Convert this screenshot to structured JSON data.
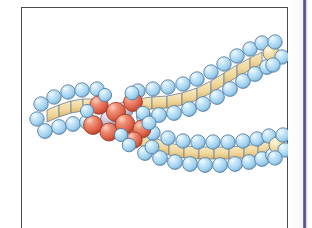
{
  "figure": {
    "caption": "",
    "background_color": "#ffffff",
    "frame_color": "#4a4a52",
    "accent_strip_color": "#5d5184"
  },
  "molecule": {
    "name": "phospholipid",
    "representation": "space-filling",
    "outline_color": "#5b6b86",
    "atoms": {
      "hydrogen": {
        "label": "hydrogen",
        "color": "#a8d4ef",
        "highlight": "#e6f5fd",
        "shadow": "#5f93bb",
        "radius": 7.2
      },
      "carbon": {
        "label": "carbon",
        "color": "#f2d79a",
        "highlight": "#fdf3d8",
        "shadow": "#cfa85c",
        "radius": 8.0
      },
      "oxygen_phosphorus": {
        "label": "oxygen / phosphorus",
        "color": "#e2634a",
        "highlight": "#f6b7a3",
        "shadow": "#b03a26",
        "radius": 9.4
      },
      "nitrogen": {
        "label": "nitrogen",
        "color": "#b9b3c4",
        "highlight": "#e4e0ea",
        "shadow": "#8b849a",
        "radius": 8.2
      }
    },
    "regions": [
      {
        "id": "head-group",
        "label": "polar head group",
        "atom_type": "oxygen_phosphorus"
      },
      {
        "id": "upper-tail",
        "label": "upper hydrocarbon tail",
        "atom_type": "carbon"
      },
      {
        "id": "lower-tail",
        "label": "lower hydrocarbon tail",
        "atom_type": "carbon"
      },
      {
        "id": "left-cap",
        "label": "choline end",
        "atom_type": "carbon"
      }
    ],
    "carbon_chain_upper": [
      [
        118,
        98
      ],
      [
        133,
        96
      ],
      [
        148,
        95
      ],
      [
        163,
        92
      ],
      [
        178,
        87
      ],
      [
        192,
        80
      ],
      [
        205,
        72
      ],
      [
        218,
        64
      ],
      [
        231,
        57
      ],
      [
        243,
        51
      ]
    ],
    "carbon_chain_lower": [
      [
        120,
        128
      ],
      [
        134,
        133
      ],
      [
        149,
        138
      ],
      [
        164,
        141
      ],
      [
        179,
        142
      ],
      [
        194,
        142
      ],
      [
        209,
        142
      ],
      [
        224,
        141
      ],
      [
        238,
        139
      ],
      [
        250,
        136
      ]
    ],
    "carbon_chain_left": [
      [
        28,
        108
      ],
      [
        40,
        103
      ],
      [
        52,
        99
      ],
      [
        64,
        97
      ],
      [
        76,
        97
      ]
    ],
    "head_group_atoms": [
      [
        78,
        99
      ],
      [
        92,
        104
      ],
      [
        70,
        118
      ],
      [
        84,
        124
      ],
      [
        98,
        118
      ],
      [
        108,
        97
      ],
      [
        112,
        112
      ],
      [
        96,
        131
      ]
    ]
  }
}
